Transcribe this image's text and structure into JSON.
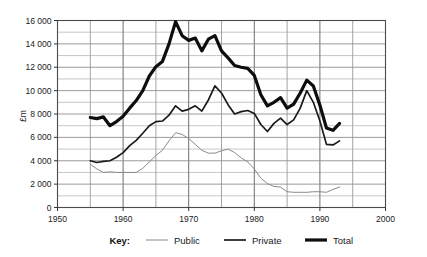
{
  "chart_data": {
    "type": "line",
    "title": "",
    "xlabel": "",
    "ylabel": "£m",
    "xlim": [
      1950,
      2000
    ],
    "ylim": [
      0,
      16000
    ],
    "x_ticks": [
      "1950",
      "1960",
      "1970",
      "1980",
      "1990",
      "2000"
    ],
    "x_tick_values": [
      1950,
      1960,
      1970,
      1980,
      1990,
      2000
    ],
    "y_ticks": [
      "0",
      "2 000",
      "4 000",
      "6 000",
      "8 000",
      "10 000",
      "12 000",
      "14 000",
      "16 000"
    ],
    "y_tick_values": [
      0,
      2000,
      4000,
      6000,
      8000,
      10000,
      12000,
      14000,
      16000
    ],
    "grid": true,
    "grid_minor_y_step": 1000,
    "grid_major_x_step": 5,
    "legend_position": "bottom",
    "legend_title": "Key:",
    "x": [
      1955,
      1956,
      1957,
      1958,
      1959,
      1960,
      1961,
      1962,
      1963,
      1964,
      1965,
      1966,
      1967,
      1968,
      1969,
      1970,
      1971,
      1972,
      1973,
      1974,
      1975,
      1976,
      1977,
      1978,
      1979,
      1980,
      1981,
      1982,
      1983,
      1984,
      1985,
      1986,
      1987,
      1988,
      1989,
      1990,
      1991,
      1992,
      1993
    ],
    "series": [
      {
        "name": "Public",
        "color": "#8a8a8a",
        "width": 1.0,
        "values": [
          3700,
          3300,
          3000,
          3050,
          3000,
          3000,
          3000,
          3000,
          3350,
          3900,
          4450,
          4900,
          5700,
          6400,
          6250,
          5900,
          5400,
          4900,
          4650,
          4650,
          4850,
          5000,
          4700,
          4250,
          3900,
          3300,
          2500,
          2050,
          1800,
          1750,
          1350,
          1300,
          1300,
          1300,
          1350,
          1350,
          1300,
          1550,
          1750
        ]
      },
      {
        "name": "Private",
        "color": "#1a1a1a",
        "width": 1.7,
        "values": [
          4000,
          3850,
          3950,
          4000,
          4300,
          4700,
          5300,
          5750,
          6350,
          7000,
          7350,
          7400,
          7900,
          8700,
          8250,
          8400,
          8700,
          8250,
          9200,
          10400,
          9800,
          8800,
          8000,
          8200,
          8300,
          8050,
          7100,
          6500,
          7200,
          7650,
          7100,
          7500,
          8500,
          10000,
          9000,
          7400,
          5400,
          5350,
          5700
        ]
      },
      {
        "name": "Total",
        "color": "#0d0d0d",
        "width": 3.2,
        "values": [
          7700,
          7600,
          7750,
          7000,
          7350,
          7800,
          8500,
          9150,
          10000,
          11250,
          12050,
          12500,
          14000,
          15900,
          14700,
          14300,
          14500,
          13400,
          14400,
          14700,
          13400,
          12800,
          12150,
          12000,
          11900,
          11300,
          9650,
          8700,
          9000,
          9400,
          8500,
          8850,
          9800,
          10900,
          10400,
          8750,
          6800,
          6600,
          7200
        ]
      }
    ]
  },
  "legend": {
    "key_label": "Key:",
    "items": [
      {
        "label": "Public"
      },
      {
        "label": "Private"
      },
      {
        "label": "Total"
      }
    ]
  }
}
